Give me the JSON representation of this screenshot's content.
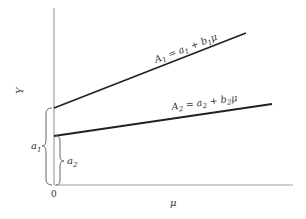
{
  "diagram": {
    "axes": {
      "y_label": "Y",
      "x_label": "μ",
      "origin_label": "0",
      "axis_color": "#9a9a9a"
    },
    "lines": [
      {
        "name": "A1",
        "equation": {
          "lhs": "A",
          "lhs_sub": "1",
          "eq": " = ",
          "a": "a",
          "a_sub": "1",
          "plus": " + ",
          "b": "b",
          "b_sub": "1",
          "var": "μ"
        },
        "color": "#222222"
      },
      {
        "name": "A2",
        "equation": {
          "lhs": "A",
          "lhs_sub": "2",
          "eq": " = ",
          "a": "a",
          "a_sub": "2",
          "plus": " + ",
          "b": "b",
          "b_sub": "2",
          "var": "μ"
        },
        "color": "#222222"
      }
    ],
    "intercepts": [
      {
        "label": "a",
        "sub": "1"
      },
      {
        "label": "a",
        "sub": "2"
      }
    ]
  }
}
